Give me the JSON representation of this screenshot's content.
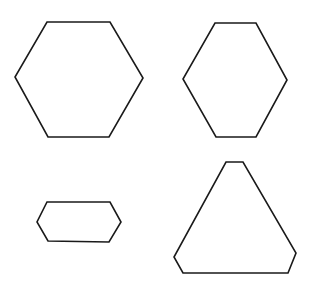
{
  "canvas": {
    "width": 311,
    "height": 282,
    "background": "#ffffff",
    "stroke_color": "#1a1a1a"
  },
  "shapes": [
    {
      "name": "regular-hexagon",
      "type": "hexagon",
      "points": "47,22 110,22 143,78 109,137 48,137 15,77"
    },
    {
      "name": "tall-hexagon",
      "type": "hexagon",
      "points": "215,23 256,23 287,80 256,137 216,137 183,79"
    },
    {
      "name": "flat-hexagon",
      "type": "hexagon",
      "points": "47,202 110,202 121,222 109,242 48,241 37,222"
    },
    {
      "name": "truncated-triangle",
      "type": "hexagon",
      "points": "226,162 243,162 296,253 288,273 183,273 174,257"
    }
  ]
}
